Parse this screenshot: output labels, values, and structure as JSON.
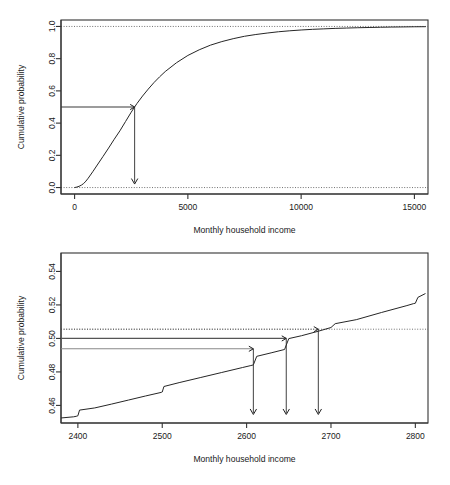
{
  "page": {
    "background": "#ffffff",
    "header_faint": "",
    "ink": "#262626"
  },
  "chart_data": [
    {
      "id": "cdf-full-range",
      "type": "line",
      "title": "",
      "xlabel": "Monthly household income",
      "ylabel": "Cumulative probability",
      "xlim": [
        -600,
        15600
      ],
      "ylim": [
        -0.04,
        1.04
      ],
      "xticks": [
        0,
        5000,
        10000,
        15000
      ],
      "xticklabels": [
        "0",
        "5000",
        "10000",
        "15000"
      ],
      "yticks": [
        0.0,
        0.2,
        0.4,
        0.6,
        0.8,
        1.0
      ],
      "yticklabels": [
        "0.0",
        "0.2",
        "0.4",
        "0.6",
        "0.8",
        "1.0"
      ],
      "grid": false,
      "legend": "none",
      "series": [
        {
          "name": "Empirical CDF of monthly household income",
          "x": [
            0,
            100,
            200,
            300,
            400,
            500,
            600,
            800,
            1000,
            1250,
            1500,
            1750,
            2000,
            2250,
            2500,
            2650,
            2750,
            3000,
            3250,
            3500,
            3750,
            4000,
            4500,
            5000,
            5500,
            6000,
            6500,
            7000,
            7500,
            8000,
            8500,
            9000,
            9500,
            10000,
            10500,
            11000,
            11500,
            12000,
            12500,
            13000,
            13500,
            14000,
            14500,
            15000,
            15500
          ],
          "y": [
            0.0,
            0.003,
            0.008,
            0.015,
            0.025,
            0.04,
            0.058,
            0.098,
            0.14,
            0.192,
            0.245,
            0.3,
            0.352,
            0.41,
            0.468,
            0.5,
            0.521,
            0.568,
            0.611,
            0.651,
            0.687,
            0.72,
            0.775,
            0.82,
            0.855,
            0.884,
            0.906,
            0.924,
            0.939,
            0.95,
            0.959,
            0.967,
            0.973,
            0.978,
            0.982,
            0.985,
            0.988,
            0.99,
            0.992,
            0.9935,
            0.995,
            0.9962,
            0.997,
            0.998,
            0.9985
          ]
        }
      ],
      "reference_lines": [
        {
          "name": "upper-dotted",
          "orientation": "horizontal",
          "value": 1.0,
          "style": "dotted"
        },
        {
          "name": "lower-dotted",
          "orientation": "horizontal",
          "value": 0.0,
          "style": "dotted"
        }
      ],
      "annotations": [
        {
          "name": "median-lookup",
          "probability": 0.5,
          "income": 2650,
          "horizontal_from_x": -600,
          "arrow_down_to_y": 0.0
        }
      ]
    },
    {
      "id": "cdf-zoom-median",
      "type": "line",
      "title": "",
      "xlabel": "Monthly household income",
      "ylabel": "Cumulative probability",
      "xlim": [
        2380,
        2815
      ],
      "ylim": [
        0.4495,
        0.551
      ],
      "xticks": [
        2400,
        2500,
        2600,
        2700,
        2800
      ],
      "xticklabels": [
        "2400",
        "2500",
        "2600",
        "2700",
        "2800"
      ],
      "yticks": [
        0.46,
        0.48,
        0.5,
        0.52,
        0.54
      ],
      "yticklabels": [
        "0.46",
        "0.48",
        "0.50",
        "0.52",
        "0.54"
      ],
      "grid": false,
      "legend": "none",
      "series": [
        {
          "name": "Empirical CDF of monthly household income (zoomed)",
          "x": [
            2380,
            2395,
            2398,
            2400,
            2402,
            2420,
            2440,
            2460,
            2480,
            2499,
            2500,
            2502,
            2520,
            2545,
            2570,
            2595,
            2605,
            2608,
            2612,
            2630,
            2645,
            2650,
            2665,
            2685,
            2700,
            2705,
            2730,
            2760,
            2790,
            2798,
            2800,
            2803,
            2812
          ],
          "y": [
            0.4525,
            0.4532,
            0.4535,
            0.4538,
            0.4572,
            0.4585,
            0.4608,
            0.4632,
            0.4656,
            0.4678,
            0.468,
            0.4713,
            0.4736,
            0.4766,
            0.4796,
            0.4826,
            0.4838,
            0.4842,
            0.4893,
            0.4915,
            0.4934,
            0.4999,
            0.5016,
            0.5043,
            0.5065,
            0.5088,
            0.5112,
            0.5155,
            0.5196,
            0.5208,
            0.521,
            0.5245,
            0.5268
          ]
        }
      ],
      "reference_lines": [
        {
          "name": "upper-dotted",
          "orientation": "horizontal",
          "value": 0.5055,
          "style": "dotted"
        }
      ],
      "annotations": [
        {
          "name": "lookup-lower",
          "probability": 0.4938,
          "income": 2608,
          "style": "light",
          "horizontal_from_x": 2380,
          "arrow_down_to_y": 0.4525
        },
        {
          "name": "lookup-median",
          "probability": 0.5,
          "income": 2647,
          "style": "mid",
          "horizontal_from_x": 2380,
          "arrow_down_to_y": 0.4525
        },
        {
          "name": "lookup-upper",
          "probability": 0.5055,
          "income": 2685,
          "style": "dotted",
          "horizontal_from_x": 2380,
          "arrow_down_to_y": 0.4525
        }
      ]
    }
  ]
}
